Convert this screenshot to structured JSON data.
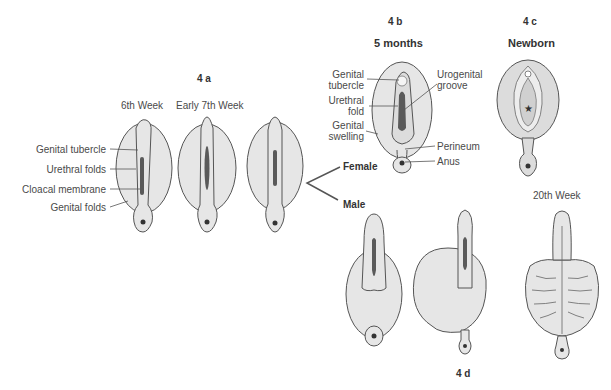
{
  "panels": {
    "a": {
      "id": "4 a",
      "stages": [
        "6th Week",
        "Early 7th Week"
      ],
      "labels": [
        "Genital tubercle",
        "Urethral folds",
        "Cloacal membrane",
        "Genital folds"
      ]
    },
    "b": {
      "id": "4 b",
      "stage": "5 months",
      "labels_left": [
        "Genital\ntubercle",
        "Urethral\nfold",
        "Genital\nswelling"
      ],
      "label_genital_1": "Genital",
      "label_tubercle": "tubercle",
      "label_urethral": "Urethral",
      "label_fold": "fold",
      "label_genital_2": "Genital",
      "label_swelling": "swelling",
      "label_urogenital": "Urogenital",
      "label_groove": "groove",
      "label_perineum": "Perineum",
      "label_anus": "Anus"
    },
    "c": {
      "id": "4 c",
      "stage": "Newborn"
    },
    "d": {
      "id": "4 d",
      "stage": "20th Week"
    }
  },
  "branch": {
    "female": "Female",
    "male": "Male"
  }
}
